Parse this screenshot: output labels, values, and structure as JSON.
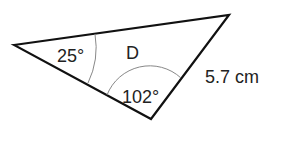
{
  "diagram": {
    "shape": "triangle",
    "name": "D",
    "vertices": {
      "left": [
        14,
        45
      ],
      "top_right": [
        229,
        15
      ],
      "bottom": [
        151,
        119
      ]
    },
    "angles": [
      {
        "label": "25°",
        "vertex": "left"
      },
      {
        "label": "102°",
        "vertex": "bottom"
      }
    ],
    "side_label": "5.7 cm",
    "side_between": [
      "top_right",
      "bottom"
    ],
    "stroke_color": "#111111",
    "arc_color": "#888888"
  }
}
